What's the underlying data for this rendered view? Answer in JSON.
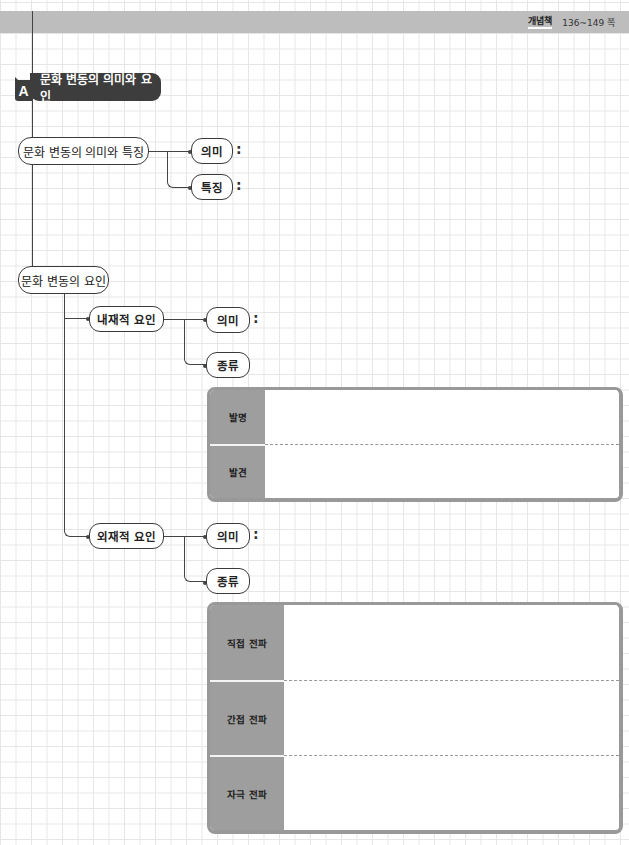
{
  "header": {
    "book_label": "개념책",
    "page_range": "136~149 쪽"
  },
  "section": {
    "badge": "A",
    "title": "문화 변동의 의미와 요인"
  },
  "meaning_and_features": {
    "node": "문화 변동의 의미와 특징",
    "children": [
      {
        "label": "의미",
        "suffix": ":"
      },
      {
        "label": "특징",
        "suffix": ":"
      }
    ]
  },
  "factors": {
    "node": "문화 변동의 요인",
    "internal": {
      "node": "내재적 요인",
      "meaning": {
        "label": "의미",
        "suffix": ":"
      },
      "types": {
        "label": "종류"
      },
      "table_rows": [
        {
          "label": "발명",
          "value": ""
        },
        {
          "label": "발견",
          "value": ""
        }
      ]
    },
    "external": {
      "node": "외재적 요인",
      "meaning": {
        "label": "의미",
        "suffix": ":"
      },
      "types": {
        "label": "종류"
      },
      "table_rows": [
        {
          "label": "직접 전파",
          "value": ""
        },
        {
          "label": "간접 전파",
          "value": ""
        },
        {
          "label": "자극 전파",
          "value": ""
        }
      ]
    }
  },
  "colors": {
    "header_band": "#bdbdbd",
    "title_fill": "#3d3d3d",
    "table_label_fill": "#9e9e9e",
    "table_border": "#999999",
    "line": "#444444"
  }
}
